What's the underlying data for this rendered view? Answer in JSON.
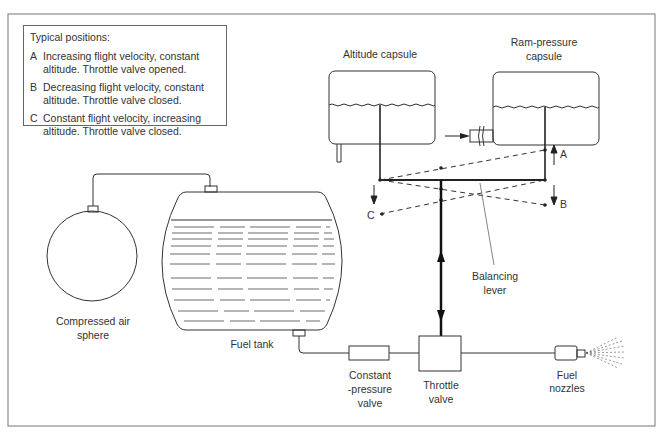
{
  "legend": {
    "title": "Typical positions:",
    "items": [
      {
        "letter": "A",
        "text": "Increasing flight velocity, constant altitude. Throttle valve opened."
      },
      {
        "letter": "B",
        "text": "Decreasing flight velocity, constant altitude. Throttle valve closed."
      },
      {
        "letter": "C",
        "text": "Constant flight velocity, increasing altitude. Throttle valve closed."
      }
    ]
  },
  "labels": {
    "altitude_capsule": "Altitude capsule",
    "ram_pressure_line1": "Ram-pressure",
    "ram_pressure_line2": "capsule",
    "balancing_line1": "Balancing",
    "balancing_line2": "lever",
    "compressed_line1": "Compressed air",
    "compressed_line2": "sphere",
    "fuel_tank": "Fuel tank",
    "constant_line1": "Constant",
    "constant_line2": "-pressure",
    "constant_line3": "valve",
    "throttle_line1": "Throttle",
    "throttle_line2": "valve",
    "nozzles_line1": "Fuel",
    "nozzles_line2": "nozzles",
    "pos_a": "A",
    "pos_b": "B",
    "pos_c": "C"
  }
}
